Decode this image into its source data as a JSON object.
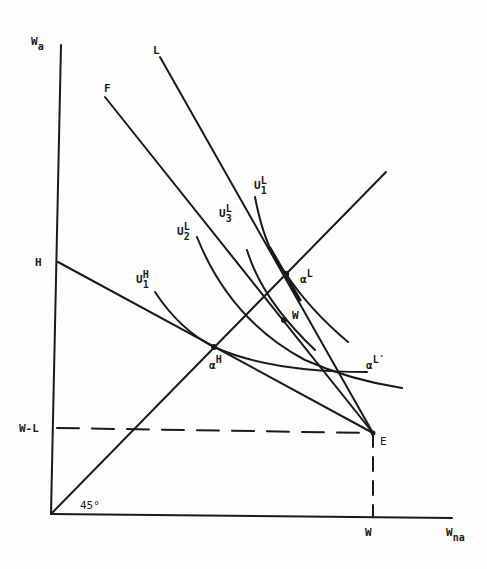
{
  "diagram": {
    "type": "economics-indifference-curve-diagram",
    "axes": {
      "y_label": {
        "base": "W",
        "sub": "a"
      },
      "x_label": {
        "base": "W",
        "sub": "na"
      }
    },
    "axis_ticks": {
      "y_H": "H",
      "y_WL": "W-L",
      "x_W": "W"
    },
    "angle_label": "45°",
    "line_labels": {
      "L": "L",
      "F": "F"
    },
    "curve_labels": {
      "U1L": {
        "base": "U",
        "sup": "L",
        "sub": "1"
      },
      "U3L": {
        "base": "U",
        "sup": "L",
        "sub": "3"
      },
      "U2L": {
        "base": "U",
        "sup": "L",
        "sub": "2"
      },
      "U1H": {
        "base": "U",
        "sup": "H",
        "sub": "1"
      }
    },
    "point_labels": {
      "alphaL": {
        "base": "α",
        "sup": "L"
      },
      "alphaH": {
        "base": "α",
        "sup": "H"
      },
      "alphaLprime": {
        "base": "α",
        "sup": "L′"
      },
      "W": "W",
      "E": "E"
    },
    "colors": {
      "ink": "#1a1a1a",
      "background": "#fdfdfd"
    }
  }
}
